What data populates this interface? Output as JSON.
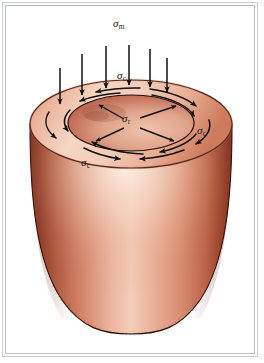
{
  "figure": {
    "title_visible": false,
    "border_color": "#c9ced2",
    "background_color": "#ffffff"
  },
  "labels": {
    "axial": {
      "symbol": "σ",
      "subscript": "m",
      "text": "σm",
      "x": 118,
      "y": 24
    },
    "hoop_top": {
      "symbol": "σ",
      "subscript": "c",
      "text": "σc",
      "x": 121,
      "y": 75
    },
    "hoop_right": {
      "symbol": "σ",
      "subscript": "c",
      "text": "σc",
      "x": 199,
      "y": 130
    },
    "hoop_bottom": {
      "symbol": "σ",
      "subscript": "c",
      "text": "σc",
      "x": 84,
      "y": 162
    },
    "radial_center": {
      "symbol": "σ",
      "subscript": "r",
      "text": "σr",
      "x": 124,
      "y": 118
    }
  },
  "colors": {
    "vessel_light": "#f6e2d6",
    "vessel_mid": "#e49a80",
    "vessel_dark": "#a6452f",
    "vessel_edge": "#7d2d1c",
    "rim_light": "#f2cbb9",
    "rim_mid": "#e5a288",
    "bore_dark": "#b65541",
    "ink": "#111111",
    "frame": "#c9ced2"
  },
  "geometry": {
    "rim_outer_ellipse": {
      "cx": 131,
      "cy": 124,
      "rx": 101,
      "ry": 44
    },
    "rim_inner_ellipse": {
      "cx": 131,
      "cy": 123,
      "rx": 63,
      "ry": 28
    },
    "body_top_y": 124,
    "body_bottom_y": 334,
    "body_half_width_top": 101,
    "body_half_width_bottom": 73
  },
  "arrows": {
    "axial_load_count": 6,
    "axial_load_positions": [
      60,
      82,
      106,
      129,
      150,
      167
    ],
    "axial_load_top_y": [
      68,
      54,
      46,
      45,
      49,
      58
    ],
    "hoop_arrow_count": 8,
    "radial_arrow_count": 4,
    "axial_direction": "down",
    "hoop_direction": "clockwise-in-plane",
    "radial_direction": "outward-from-center"
  },
  "legend_items": [
    {
      "name": "sigma-m",
      "meaning": "axial / membrane stress",
      "label": "σm"
    },
    {
      "name": "sigma-c",
      "meaning": "circumferential (hoop) stress",
      "label": "σc"
    },
    {
      "name": "sigma-r",
      "meaning": "radial stress",
      "label": "σr"
    }
  ]
}
